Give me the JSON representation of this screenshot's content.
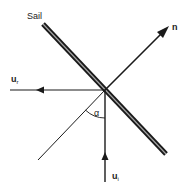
{
  "diagram": {
    "sail_label": "Sail",
    "normal_label": "n",
    "reflected_label": "u",
    "reflected_sub": "r",
    "incident_label": "u",
    "incident_sub": "i",
    "angle_label": "α",
    "colors": {
      "ink": "#1a1a1a",
      "background": "#ffffff",
      "text": "#333333"
    }
  }
}
